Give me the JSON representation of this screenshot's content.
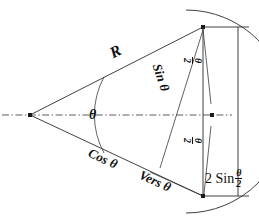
{
  "figure": {
    "background_color": "#ffffff",
    "line_color": "#2b2b2b",
    "width": 259,
    "height": 222
  },
  "labels": {
    "radius": "R",
    "sine": "Sin θ",
    "cosine": "Cos θ",
    "versine": "Vers θ",
    "angle": "θ",
    "half_angle_upper_num": "θ",
    "half_angle_upper_den": "2",
    "half_angle_lower_num": "θ",
    "half_angle_lower_den": "2",
    "chord_prefix": "2 Sin",
    "chord_num": "θ",
    "chord_den": "2"
  },
  "geometry": {
    "center_x": 30,
    "center_y": 115,
    "top_point_x": 203,
    "top_point_y": 27,
    "bottom_point_x": 203,
    "bottom_point_y": 196,
    "arc_mid_x": 213,
    "arc_mid_y": 115,
    "radius_value": "R",
    "angle_value": "θ",
    "half_angle_value": "θ/2",
    "chord_value": "2 Sin θ/2"
  },
  "elements": {
    "centerline_style": "dash-dot",
    "arc_style": "solid",
    "dimension_line_style": "solid with end ticks"
  }
}
